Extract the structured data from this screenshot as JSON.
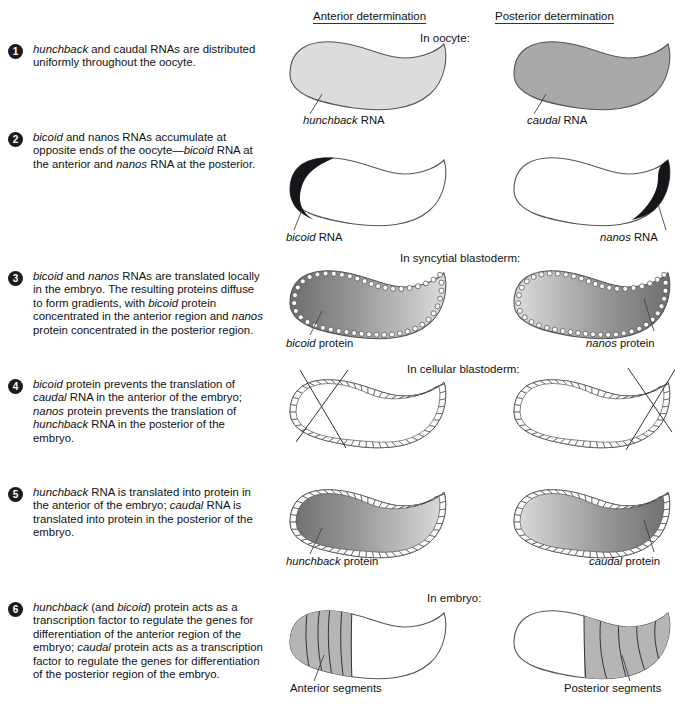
{
  "headers": {
    "anterior": "Anterior determination",
    "posterior": "Posterior determination"
  },
  "stage_labels": {
    "oocyte": "In oocyte:",
    "syncytial": "In syncytial blastoderm:",
    "cellular": "In cellular blastoderm:",
    "embryo": "In embryo:"
  },
  "colors": {
    "outline": "#3b3b3b",
    "bullet_bg": "#1b1b1b",
    "bullet_text": "#ffffff",
    "light_gray": "#dcdcdc",
    "mid_gray": "#a8a8a8",
    "dark_gray": "#8c8c8c",
    "rna_cap": "#15151a",
    "segment_fill": "#b5b5b5",
    "text": "#111111"
  },
  "steps": [
    {
      "number": "1",
      "text_parts": [
        {
          "t": "hunchback",
          "i": true
        },
        {
          "t": " and caudal RNAs are distributed uniformly throughout the oocyte.",
          "i": false
        }
      ],
      "plain": "hunchback and caudal RNAs are distributed uniformly throughout the oocyte."
    },
    {
      "number": "2",
      "text_parts": [
        {
          "t": "bicoid",
          "i": true
        },
        {
          "t": " and nanos RNAs accumulate at opposite ends of the oocyte—",
          "i": false
        },
        {
          "t": "bicoid",
          "i": true
        },
        {
          "t": " RNA at the anterior and ",
          "i": false
        },
        {
          "t": "nanos",
          "i": true
        },
        {
          "t": " RNA at the posterior.",
          "i": false
        }
      ],
      "plain": "bicoid and nanos RNAs accumulate at opposite ends of the oocyte—bicoid RNA at the anterior and nanos RNA at the posterior."
    },
    {
      "number": "3",
      "text_parts": [
        {
          "t": "bicoid",
          "i": true
        },
        {
          "t": " and ",
          "i": false
        },
        {
          "t": "nanos",
          "i": true
        },
        {
          "t": " RNAs are translated locally in the embryo. The resulting proteins diffuse to form gradients, with ",
          "i": false
        },
        {
          "t": "bicoid",
          "i": true
        },
        {
          "t": " protein concentrated in the anterior region and ",
          "i": false
        },
        {
          "t": "nanos",
          "i": true
        },
        {
          "t": " protein concentrated in the posterior region.",
          "i": false
        }
      ],
      "plain": "bicoid and nanos RNAs are translated locally in the embryo. The resulting proteins diffuse to form gradients, with bicoid protein concentrated in the anterior region and nanos protein concentrated in the posterior region."
    },
    {
      "number": "4",
      "text_parts": [
        {
          "t": "bicoid",
          "i": true
        },
        {
          "t": " protein prevents the translation of ",
          "i": false
        },
        {
          "t": "caudal",
          "i": true
        },
        {
          "t": " RNA in the anterior of the embryo; ",
          "i": false
        },
        {
          "t": "nanos",
          "i": true
        },
        {
          "t": " protein prevents the translation of ",
          "i": false
        },
        {
          "t": "hunchback",
          "i": true
        },
        {
          "t": " RNA in the posterior of the embryo.",
          "i": false
        }
      ],
      "plain": "bicoid protein prevents the translation of caudal RNA in the anterior of the embryo; nanos protein prevents the translation of hunchback RNA in the posterior of the embryo."
    },
    {
      "number": "5",
      "text_parts": [
        {
          "t": "hunchback",
          "i": true
        },
        {
          "t": " RNA is translated into protein in the anterior of the embryo; ",
          "i": false
        },
        {
          "t": "caudal",
          "i": true
        },
        {
          "t": " RNA is translated into protein in the posterior of the embryo.",
          "i": false
        }
      ],
      "plain": "hunchback RNA is translated into protein in the anterior of the embryo; caudal RNA is translated into protein in the posterior of the embryo."
    },
    {
      "number": "6",
      "text_parts": [
        {
          "t": "hunchback",
          "i": true
        },
        {
          "t": " (and ",
          "i": false
        },
        {
          "t": "bicoid",
          "i": true
        },
        {
          "t": ") protein acts as a transcription factor to regulate the genes for differentiation of the anterior region of the embryo; ",
          "i": false
        },
        {
          "t": "caudal",
          "i": true
        },
        {
          "t": " protein acts as a transcription factor to regulate the genes for differentiation of the posterior region of the embryo.",
          "i": false
        }
      ],
      "plain": "hunchback (and bicoid) protein acts as a transcription factor to regulate the genes for differentiation of the anterior region of the embryo; caudal protein acts as a transcription factor to regulate the genes for differentiation of the posterior region of the embryo."
    }
  ],
  "callouts": {
    "hunchback_rna": {
      "italic": "hunchback",
      "rest": " RNA"
    },
    "caudal_rna": {
      "italic": "caudal",
      "rest": " RNA"
    },
    "bicoid_rna": {
      "italic": "bicoid",
      "rest": " RNA"
    },
    "nanos_rna": {
      "italic": "nanos",
      "rest": " RNA"
    },
    "bicoid_protein": {
      "italic": "bicoid",
      "rest": " protein"
    },
    "nanos_protein": {
      "italic": "nanos",
      "rest": " protein"
    },
    "hunchback_protein": {
      "italic": "hunchback",
      "rest": " protein"
    },
    "caudal_protein": {
      "italic": "caudal",
      "rest": " protein"
    },
    "anterior_segments": {
      "italic": "",
      "rest": "Anterior segments"
    },
    "posterior_segments": {
      "italic": "",
      "rest": "Posterior segments"
    }
  }
}
